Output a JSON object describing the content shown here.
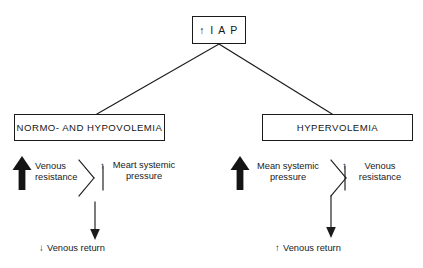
{
  "figure": {
    "type": "flow-diagram",
    "background_color": "#ffffff",
    "line_color": "#1b1b1b"
  },
  "nodes": {
    "root": {
      "label": "↑ I A P",
      "name": "intra-abdominal-pressure"
    },
    "left_branch": {
      "label": "NORMO- AND HYPOVOLEMIA"
    },
    "right_branch": {
      "label": "HYPERVOLEMIA"
    }
  },
  "left_path": {
    "primary_effect": "Venous\nresistance",
    "primary_arrow": "up-bold",
    "secondary_arrow": "↑",
    "secondary_effect": "Meart systemic\npressure",
    "outcome_arrow": "↓",
    "outcome": "Venous return"
  },
  "right_path": {
    "primary_effect": "Mean systemic\npressure",
    "primary_arrow": "up-bold",
    "secondary_arrow": "↑",
    "secondary_effect": "Venous\nresistance",
    "outcome_arrow": "↑",
    "outcome": "Venous return"
  }
}
